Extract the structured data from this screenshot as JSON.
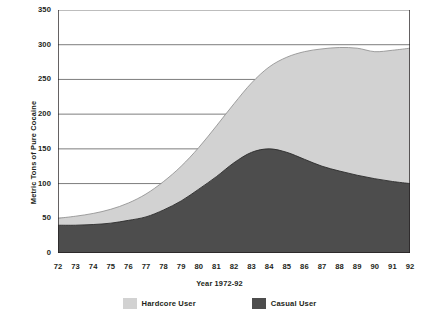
{
  "chart_data": {
    "type": "area",
    "title": "",
    "xlabel": "Year 1972-92",
    "ylabel": "Metric Tons of Pure Cocaine",
    "stacked": true,
    "grid": true,
    "legend_position": "bottom",
    "ylim": [
      0,
      350
    ],
    "yticks": [
      0,
      50,
      100,
      150,
      200,
      250,
      300,
      350
    ],
    "categories": [
      "72",
      "73",
      "74",
      "75",
      "76",
      "77",
      "78",
      "79",
      "80",
      "81",
      "82",
      "83",
      "84",
      "85",
      "86",
      "87",
      "88",
      "89",
      "90",
      "91",
      "92"
    ],
    "x_full_years": [
      1972,
      1973,
      1974,
      1975,
      1976,
      1977,
      1978,
      1979,
      1980,
      1981,
      1982,
      1983,
      1984,
      1985,
      1986,
      1987,
      1988,
      1989,
      1990,
      1991,
      1992
    ],
    "series": [
      {
        "name": "Casual User",
        "color": "#4d4d4d",
        "values": [
          40,
          40,
          41,
          43,
          47,
          52,
          62,
          75,
          92,
          110,
          130,
          145,
          150,
          145,
          135,
          125,
          118,
          112,
          107,
          103,
          100
        ]
      },
      {
        "name": "Hardcore User",
        "color": "#d2d2d2",
        "values": [
          10,
          13,
          16,
          20,
          25,
          33,
          41,
          50,
          60,
          73,
          85,
          100,
          118,
          137,
          155,
          169,
          178,
          183,
          183,
          189,
          195
        ]
      }
    ],
    "totals": [
      50,
      53,
      57,
      63,
      72,
      85,
      103,
      125,
      152,
      183,
      215,
      245,
      268,
      282,
      290,
      294,
      296,
      295,
      290,
      292,
      295
    ]
  },
  "axis": {
    "y_title": "Metric Tons of Pure Cocaine",
    "x_title": "Year 1972-92",
    "y_tick_labels": [
      "350",
      "300",
      "250",
      "200",
      "150",
      "100",
      "50",
      "0"
    ],
    "x_tick_labels": [
      "72",
      "73",
      "74",
      "75",
      "76",
      "77",
      "78",
      "79",
      "80",
      "81",
      "82",
      "83",
      "84",
      "85",
      "86",
      "87",
      "88",
      "89",
      "90",
      "91",
      "92"
    ]
  },
  "legend": {
    "items": [
      {
        "label": "Hardcore User",
        "color": "#d2d2d2"
      },
      {
        "label": "Casual User",
        "color": "#4d4d4d"
      }
    ]
  },
  "colors": {
    "hardcore": "#d2d2d2",
    "casual": "#4d4d4d",
    "gridline": "#6e6e6e",
    "axis": "#231f20",
    "background": "#ffffff"
  }
}
